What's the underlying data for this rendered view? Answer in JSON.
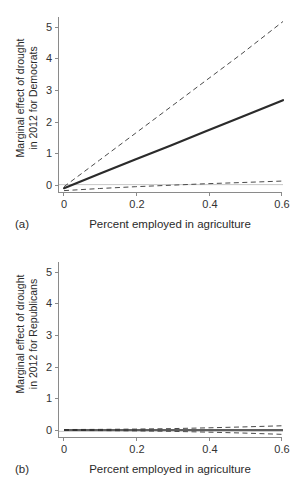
{
  "figure": {
    "width": 303,
    "height": 484,
    "background": "#ffffff",
    "line_color": "#2b2b2b",
    "ci_color": "#4a4a4a",
    "axis_color": "#8a8a8a"
  },
  "panels": [
    {
      "caption": "(a)",
      "ylabel_line1": "Marginal effect of drought",
      "ylabel_line2": "in 2012 for Democrats",
      "xlabel": "Percent employed in agriculture",
      "yticks": [
        "0",
        "1",
        "2",
        "3",
        "4",
        "5"
      ],
      "xticks": [
        "0",
        "0.2",
        "0.4",
        "0.6"
      ]
    },
    {
      "caption": "(b)",
      "ylabel_line1": "Marginal effect of drought",
      "ylabel_line2": "in 2012 for Republicans",
      "xlabel": "Percent employed in agriculture",
      "yticks": [
        "0",
        "1",
        "2",
        "3",
        "4",
        "5"
      ],
      "xticks": [
        "0",
        "0.2",
        "0.4",
        "0.6"
      ]
    }
  ],
  "chart_data": [
    {
      "type": "line",
      "panel": "(a)",
      "title": "",
      "xlabel": "Percent employed in agriculture",
      "ylabel": "Marginal effect of drought in 2012 for Democrats",
      "xlim": [
        0,
        0.615
      ],
      "ylim": [
        -0.28,
        5.6
      ],
      "xticks": [
        0,
        0.2,
        0.4,
        0.6
      ],
      "xticklabels": [
        "0",
        "0.2",
        "0.4",
        "0.6"
      ],
      "yticks": [
        0,
        1,
        2,
        3,
        4,
        5
      ],
      "yticklabels": [
        "0",
        "1",
        "2",
        "3",
        "4",
        "5"
      ],
      "grid": false,
      "legend": "none",
      "zero_line": true,
      "x": [
        0,
        0.1,
        0.2,
        0.3,
        0.4,
        0.5,
        0.615
      ],
      "series": [
        {
          "name": "Marginal effect (point estimate)",
          "style": "solid",
          "width": 2.2,
          "color": "#2b2b2b",
          "values": [
            -0.12,
            0.36,
            0.84,
            1.31,
            1.79,
            2.27,
            2.82
          ]
        },
        {
          "name": "Upper 95% confidence bound",
          "style": "dashed",
          "width": 1.0,
          "color": "#4a4a4a",
          "values": [
            -0.07,
            0.82,
            1.71,
            2.6,
            3.49,
            4.38,
            5.45
          ]
        },
        {
          "name": "Lower 95% confidence bound",
          "style": "dashed",
          "width": 1.0,
          "color": "#4a4a4a",
          "values": [
            -0.2,
            -0.13,
            -0.07,
            -0.02,
            0.03,
            0.07,
            0.12
          ]
        }
      ]
    },
    {
      "type": "line",
      "panel": "(b)",
      "title": "",
      "xlabel": "Percent employed in agriculture",
      "ylabel": "Marginal effect of drought in 2012 for Republicans",
      "xlim": [
        0,
        0.615
      ],
      "ylim": [
        -0.22,
        5.6
      ],
      "xticks": [
        0,
        0.2,
        0.4,
        0.6
      ],
      "xticklabels": [
        "0",
        "0.2",
        "0.4",
        "0.6"
      ],
      "yticks": [
        0,
        1,
        2,
        3,
        4,
        5
      ],
      "yticklabels": [
        "0",
        "1",
        "2",
        "3",
        "4",
        "5"
      ],
      "grid": false,
      "legend": "none",
      "zero_line": true,
      "x": [
        0,
        0.1,
        0.2,
        0.3,
        0.4,
        0.5,
        0.615
      ],
      "series": [
        {
          "name": "Marginal effect (point estimate)",
          "style": "solid",
          "width": 1.6,
          "color": "#2b2b2b",
          "values": [
            0.045,
            0.045,
            0.045,
            0.045,
            0.045,
            0.045,
            0.045
          ]
        },
        {
          "name": "Upper 95% confidence bound",
          "style": "dashed",
          "width": 1.0,
          "color": "#4a4a4a",
          "values": [
            0.06,
            0.065,
            0.075,
            0.09,
            0.115,
            0.145,
            0.185
          ]
        },
        {
          "name": "Lower 95% confidence bound",
          "style": "dashed",
          "width": 1.0,
          "color": "#4a4a4a",
          "values": [
            0.03,
            0.025,
            0.015,
            0.0,
            -0.025,
            -0.055,
            -0.1
          ]
        }
      ]
    }
  ]
}
